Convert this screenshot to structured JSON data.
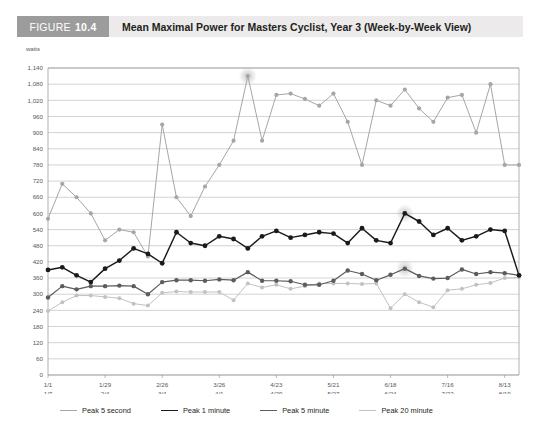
{
  "header": {
    "figure_word": "FIGURE",
    "figure_number": "10.4",
    "title": "Mean Maximal Power for Masters Cyclist, Year 3 (Week-by-Week View)",
    "tag_bg": "#9c9c9c",
    "bar_bg": "#eceaea"
  },
  "chart_data": {
    "type": "line",
    "title": "Mean Maximal Power for Masters Cyclist, Year 3 (Week-by-Week View)",
    "xlabel": "",
    "ylabel": "watts",
    "ylim": [
      0,
      1140
    ],
    "ytick_step": 60,
    "grid": true,
    "legend_position": "bottom",
    "yticks": [
      "0",
      "60",
      "120",
      "180",
      "240",
      "300",
      "360",
      "420",
      "480",
      "540",
      "600",
      "660",
      "720",
      "780",
      "840",
      "900",
      "960",
      "1,020",
      "1,080",
      "1,140"
    ],
    "ytick_values": [
      0,
      60,
      120,
      180,
      240,
      300,
      360,
      420,
      480,
      540,
      600,
      660,
      720,
      780,
      840,
      900,
      960,
      1020,
      1080,
      1140
    ],
    "xtick_labels": [
      {
        "index": 0,
        "top": "1/1",
        "bottom": "1/7"
      },
      {
        "index": 4,
        "top": "1/29",
        "bottom": "2/4"
      },
      {
        "index": 8,
        "top": "2/26",
        "bottom": "3/4"
      },
      {
        "index": 12,
        "top": "3/26",
        "bottom": "4/1"
      },
      {
        "index": 16,
        "top": "4/23",
        "bottom": "4/29"
      },
      {
        "index": 20,
        "top": "5/21",
        "bottom": "5/27"
      },
      {
        "index": 24,
        "top": "6/18",
        "bottom": "6/24"
      },
      {
        "index": 28,
        "top": "7/16",
        "bottom": "7/22"
      },
      {
        "index": 32,
        "top": "8/13",
        "bottom": "8/19"
      }
    ],
    "n_points": 34,
    "series": [
      {
        "name": "Peak 5 second",
        "color": "#a6a6a6",
        "width": 1.0,
        "marker": 2.1,
        "values": [
          580,
          710,
          660,
          600,
          500,
          540,
          530,
          440,
          930,
          660,
          590,
          700,
          780,
          870,
          1110,
          870,
          1040,
          1045,
          1025,
          1000,
          1045,
          940,
          780,
          1020,
          1000,
          1060,
          990,
          940,
          1030,
          1040,
          900,
          1080,
          780,
          780
        ]
      },
      {
        "name": "Peak 1 minute",
        "color": "#1a1a1a",
        "width": 1.45,
        "marker": 2.4,
        "values": [
          390,
          400,
          370,
          345,
          395,
          425,
          470,
          450,
          415,
          530,
          490,
          480,
          515,
          505,
          470,
          515,
          535,
          510,
          520,
          530,
          525,
          490,
          545,
          500,
          490,
          600,
          570,
          520,
          545,
          500,
          515,
          540,
          535,
          370
        ]
      },
      {
        "name": "Peak 5 minute",
        "color": "#5c5c5c",
        "width": 1.2,
        "marker": 2.2,
        "values": [
          288,
          330,
          318,
          330,
          330,
          332,
          330,
          300,
          345,
          352,
          352,
          350,
          355,
          352,
          382,
          350,
          350,
          348,
          335,
          335,
          350,
          388,
          375,
          352,
          372,
          395,
          368,
          358,
          360,
          392,
          375,
          382,
          378,
          370
        ]
      },
      {
        "name": "Peak 20 minute",
        "color": "#c2c2c2",
        "width": 1.0,
        "marker": 2.0,
        "values": [
          238,
          270,
          295,
          295,
          290,
          285,
          265,
          258,
          305,
          310,
          308,
          308,
          308,
          278,
          340,
          325,
          335,
          320,
          330,
          340,
          340,
          340,
          338,
          340,
          248,
          300,
          270,
          252,
          315,
          320,
          335,
          342,
          360,
          362
        ]
      }
    ],
    "highlights": [
      {
        "series": "Peak 5 second",
        "index": 14,
        "value": 1110
      },
      {
        "series": "Peak 1 minute",
        "index": 25,
        "value": 600
      },
      {
        "series": "Peak 5 minute",
        "index": 25,
        "value": 395
      }
    ]
  },
  "legend": {
    "items": [
      {
        "label": "Peak 5 second",
        "color": "#a6a6a6",
        "width": "1px"
      },
      {
        "label": "Peak 1 minute",
        "color": "#1a1a1a",
        "width": "1.6px"
      },
      {
        "label": "Peak 5 minute",
        "color": "#5c5c5c",
        "width": "1.2px"
      },
      {
        "label": "Peak 20 minute",
        "color": "#c2c2c2",
        "width": "1px"
      }
    ]
  }
}
